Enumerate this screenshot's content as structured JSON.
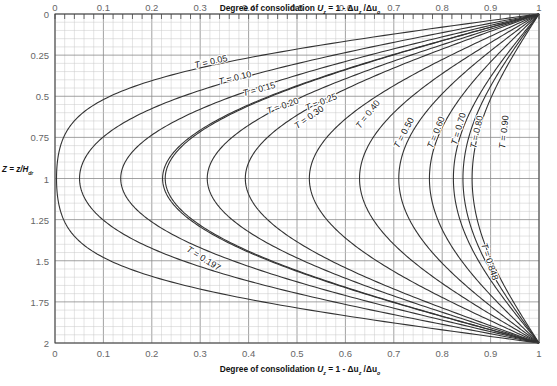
{
  "chart_data": {
    "type": "line",
    "xlabel_top": "Degree of consolidation U_z = 1 - Δu_z / Δu_0",
    "xlabel_bottom": "Degree of consolidation U_z = 1 - Δu_z / Δu_0",
    "ylabel": "Z = z/H_dr",
    "xlim": [
      0,
      1
    ],
    "ylim": [
      2,
      0
    ],
    "x_ticks": [
      "0",
      "0.1",
      "0.2",
      "0.3",
      "0.4",
      "0.5",
      "0.6",
      "0.7",
      "0.8",
      "0.9",
      "1"
    ],
    "y_ticks": [
      "0",
      "0.25",
      "0.5",
      "0.75",
      "1",
      "1.25",
      "1.5",
      "1.75",
      "2"
    ],
    "grid": true,
    "series": [
      {
        "name": "T = 0.05",
        "T": 0.05,
        "label": "T = 0.05",
        "label_pos": [
          0.29,
          0.33
        ],
        "label_rot": -13
      },
      {
        "name": "T = 0.10",
        "T": 0.1,
        "label": "T = 0.10",
        "label_pos": [
          0.34,
          0.43
        ],
        "label_rot": -14
      },
      {
        "name": "T = 0.15",
        "T": 0.15,
        "label": "T = 0.15",
        "label_pos": [
          0.39,
          0.5
        ],
        "label_rot": -15
      },
      {
        "name": "T = 0.20",
        "T": 0.2,
        "label": "T = 0.20",
        "label_pos": [
          0.44,
          0.61
        ],
        "label_rot": -20
      },
      {
        "name": "T = 0.197",
        "T": 0.197,
        "label": "T = 0.197",
        "label_pos": [
          0.27,
          1.44
        ],
        "label_rot": 32
      },
      {
        "name": "T = 0.25",
        "T": 0.25,
        "label": "T = 0.25",
        "label_pos": [
          0.52,
          0.59
        ],
        "label_rot": -22
      },
      {
        "name": "T = 0.30",
        "T": 0.3,
        "label": "T = 0.30",
        "label_pos": [
          0.5,
          0.7
        ],
        "label_rot": -35
      },
      {
        "name": "T = 0.40",
        "T": 0.4,
        "label": "T = 0.40",
        "label_pos": [
          0.63,
          0.7
        ],
        "label_rot": -52
      },
      {
        "name": "T = 0.50",
        "T": 0.5,
        "label": "T = 0.50",
        "label_pos": [
          0.71,
          0.82
        ],
        "label_rot": -62
      },
      {
        "name": "T = 0.60",
        "T": 0.6,
        "label": "T = 0.60",
        "label_pos": [
          0.78,
          0.82
        ],
        "label_rot": -68
      },
      {
        "name": "T = 0.70",
        "T": 0.7,
        "label": "T = 0.70",
        "label_pos": [
          0.83,
          0.8
        ],
        "label_rot": -74
      },
      {
        "name": "T = 0.80",
        "T": 0.8,
        "label": "T = 0.80",
        "label_pos": [
          0.87,
          0.82
        ],
        "label_rot": -78
      },
      {
        "name": "T = 0.848",
        "T": 0.848,
        "label": "T = 0.848",
        "label_pos": [
          0.88,
          1.4
        ],
        "label_rot": 72
      },
      {
        "name": "T = 0.90",
        "T": 0.9,
        "label": "T = 0.90",
        "label_pos": [
          0.93,
          0.82
        ],
        "label_rot": -84
      }
    ]
  },
  "axes": {
    "top_title": "Degree of consolidation",
    "bottom_title": "Degree of consolidation",
    "formula_u": "U",
    "formula_sub": "z",
    "formula_rest": " = 1 - Δu",
    "formula_sub2": "z",
    "formula_div": " /Δu",
    "formula_sub3": "o",
    "ylabel": "Z = z/H",
    "ylabel_sub": "dr"
  },
  "colors": {
    "curve": "#333333",
    "grid_minor": "#c8c8c8",
    "grid_major": "#8a8a8a",
    "frame": "#444444",
    "tick_text": "#666666"
  }
}
